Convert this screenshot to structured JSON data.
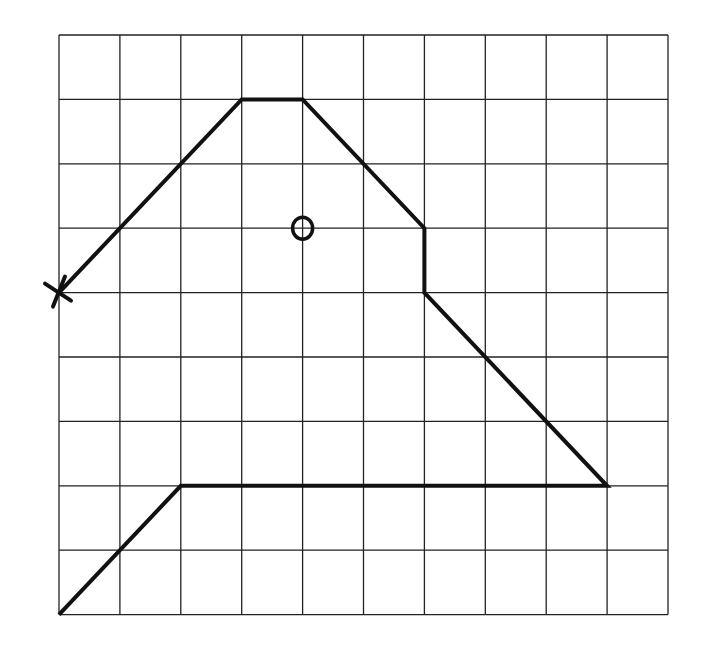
{
  "diagram": {
    "type": "grid-path",
    "grid": {
      "columns": 10,
      "rows": 9,
      "origin_px": [
        59,
        35
      ],
      "cell_w": 60.9,
      "cell_h": 64.4,
      "line_color": "#222222"
    },
    "path": {
      "color": "#111111",
      "points": [
        [
          0,
          4
        ],
        [
          3,
          1
        ],
        [
          4,
          1
        ],
        [
          6,
          3
        ],
        [
          6,
          4
        ],
        [
          9,
          7
        ],
        [
          2,
          7
        ],
        [
          0,
          9
        ]
      ]
    },
    "markers": [
      {
        "type": "cross",
        "label": "start-x",
        "at": [
          0,
          4
        ]
      },
      {
        "type": "circle",
        "label": "circle-o",
        "at": [
          4,
          3
        ]
      }
    ]
  }
}
